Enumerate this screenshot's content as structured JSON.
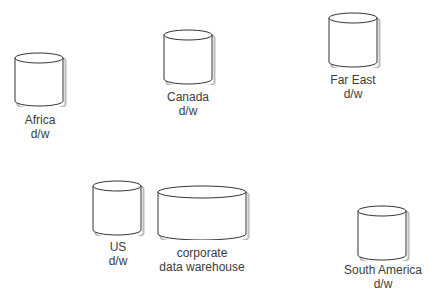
{
  "diagram": {
    "nodes": [
      {
        "id": "africa",
        "shape": "cylinder",
        "line1": "Africa",
        "line2": "d/w"
      },
      {
        "id": "canada",
        "shape": "cylinder",
        "line1": "Canada",
        "line2": "d/w"
      },
      {
        "id": "far_east",
        "shape": "cylinder",
        "line1": "Far East",
        "line2": "d/w"
      },
      {
        "id": "us",
        "shape": "cylinder",
        "line1": "US",
        "line2": "d/w"
      },
      {
        "id": "corporate",
        "shape": "wide-cylinder",
        "line1": "corporate",
        "line2": "data warehouse"
      },
      {
        "id": "south_america",
        "shape": "cylinder",
        "line1": "South America",
        "line2": "d/w"
      }
    ],
    "colors": {
      "stroke": "#333333",
      "shadow": "#bbbbbb",
      "text": "#3c3c3c",
      "background": "#ffffff"
    }
  }
}
